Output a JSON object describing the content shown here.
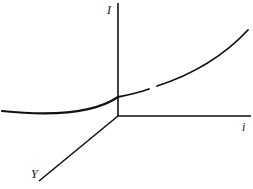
{
  "diagram": {
    "type": "3d-axes-curve",
    "colors": {
      "ink": "#111111",
      "background": "#ffffff"
    },
    "axes": {
      "vertical": {
        "label": "I"
      },
      "horizontal": {
        "label": "i"
      },
      "diagonal": {
        "label": "Y"
      }
    },
    "curve": {
      "description": "Convex upward-sloping curve crossing the I axis above the origin, extending left and flattening, rising to the upper right"
    }
  }
}
